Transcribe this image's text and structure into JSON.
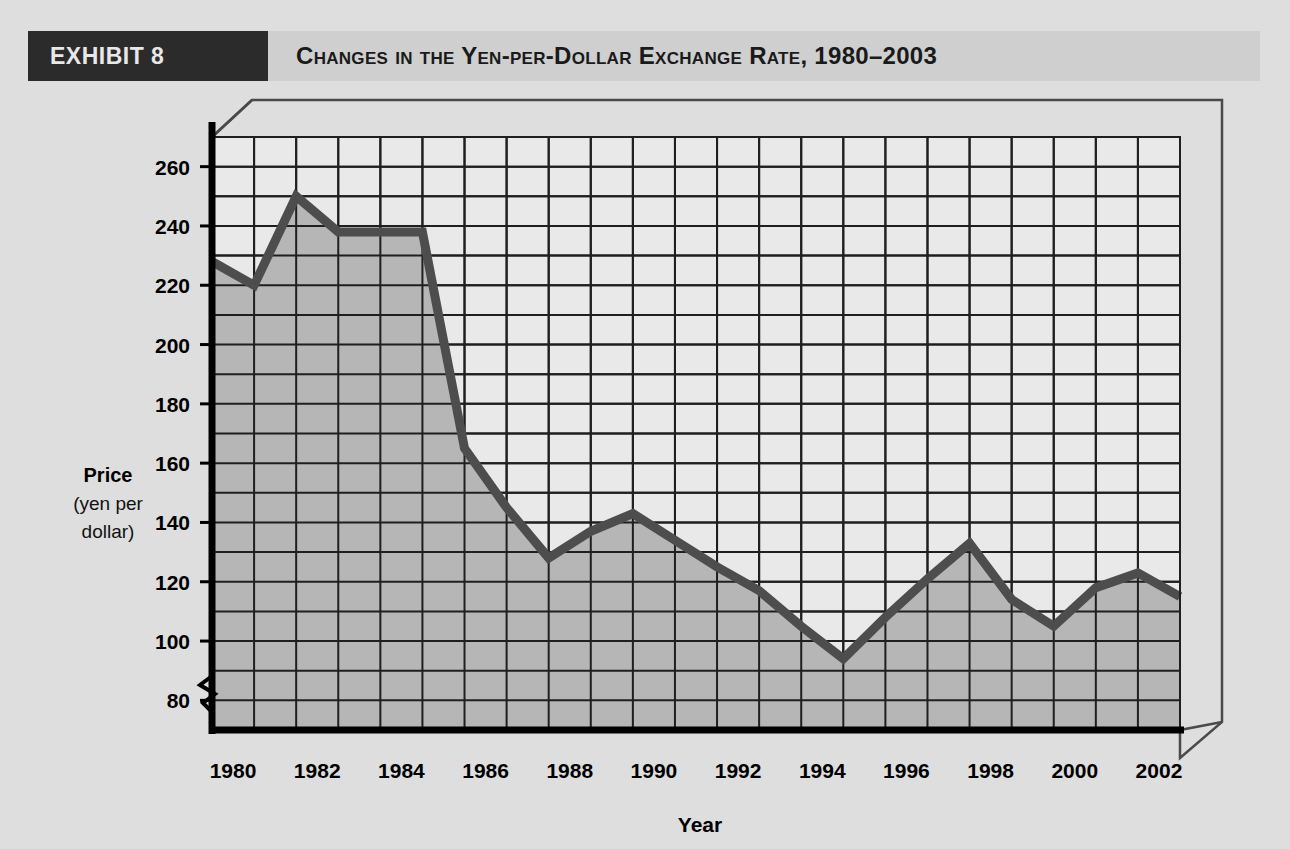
{
  "header": {
    "exhibit_tag": "EXHIBIT 8",
    "title": "Changes in the Yen-per-Dollar Exchange Rate, 1980–2003"
  },
  "colors": {
    "page_background": "#dedede",
    "banner_background": "#cfcfcf",
    "tag_background": "#2b2b2b",
    "tag_text": "#e8e8e8",
    "title_text": "#1a1a1a",
    "plot_background": "#e9e9e9",
    "area_fill": "#b6b6b6",
    "gridline": "#1f1f1f",
    "series_line": "#4d4d4d",
    "axis_line": "#000000"
  },
  "chart_data": {
    "type": "area",
    "title": "Changes in the Yen-per-Dollar Exchange Rate, 1980–2003",
    "xlabel": "Year",
    "ylabel": "Price (yen per dollar)",
    "ylabel_line1": "Price",
    "ylabel_line2": "(yen per",
    "ylabel_line3": "dollar)",
    "ylim": [
      70,
      270
    ],
    "y_axis_break": true,
    "y_major_step": 20,
    "y_minor_step": 10,
    "grid": true,
    "legend": "none",
    "yticks": [
      80,
      100,
      120,
      140,
      160,
      180,
      200,
      220,
      240,
      260
    ],
    "xticks": [
      1980,
      1982,
      1984,
      1986,
      1988,
      1990,
      1992,
      1994,
      1996,
      1998,
      2000,
      2002
    ],
    "xlim": [
      1980,
      2003
    ],
    "x": [
      1980,
      1981,
      1982,
      1983,
      1984,
      1985,
      1986,
      1987,
      1988,
      1989,
      1990,
      1991,
      1992,
      1993,
      1994,
      1995,
      1996,
      1997,
      1998,
      1999,
      2000,
      2001,
      2002,
      2003
    ],
    "values": [
      228,
      220,
      250,
      238,
      238,
      238,
      165,
      145,
      128,
      137,
      143,
      134,
      125,
      117,
      105,
      94,
      108,
      121,
      133,
      114,
      105,
      118,
      123,
      115
    ],
    "series": [
      {
        "name": "Yen per dollar",
        "values": [
          228,
          220,
          250,
          238,
          238,
          238,
          165,
          145,
          128,
          137,
          143,
          134,
          125,
          117,
          105,
          94,
          108,
          121,
          133,
          114,
          105,
          118,
          123,
          115
        ]
      }
    ]
  }
}
